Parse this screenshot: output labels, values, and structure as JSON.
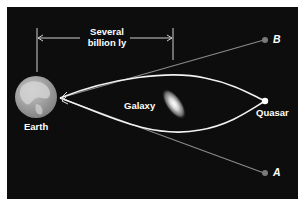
{
  "diagram": {
    "colors": {
      "background": "#0d0d0d",
      "frame": "#ffffff",
      "lensed_path": "#f2f2f2",
      "apparent_path": "#8a8a8a",
      "apparent_point": "#7a7a7a",
      "quasar": "#ffffff",
      "earth": "#9a9a9a"
    },
    "labels": {
      "distance_line1": "Several",
      "distance_line2": "billion ly",
      "earth": "Earth",
      "galaxy": "Galaxy",
      "quasar": "Quasar",
      "image_a": "A",
      "image_b": "B"
    },
    "nodes": [
      {
        "id": "earth",
        "label": "Earth",
        "icon": "globe-icon"
      },
      {
        "id": "galaxy",
        "label": "Galaxy",
        "icon": "elliptical-galaxy-icon"
      },
      {
        "id": "quasar",
        "label": "Quasar",
        "icon": "bright-point-icon"
      },
      {
        "id": "image_a",
        "label": "A",
        "icon": "apparent-image-dot"
      },
      {
        "id": "image_b",
        "label": "B",
        "icon": "apparent-image-dot"
      }
    ],
    "edges": [
      {
        "from": "quasar",
        "to": "earth",
        "style": "curved-bright",
        "via": "above galaxy"
      },
      {
        "from": "quasar",
        "to": "earth",
        "style": "curved-bright",
        "via": "below galaxy"
      },
      {
        "from": "image_b",
        "to": "earth",
        "style": "straight-gray"
      },
      {
        "from": "image_a",
        "to": "earth",
        "style": "straight-gray"
      }
    ],
    "dimension": {
      "label": "Several billion ly",
      "from": "earth",
      "to": "galaxy"
    }
  }
}
